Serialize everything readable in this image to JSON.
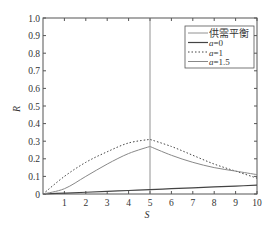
{
  "chart_data": {
    "type": "line",
    "title": "",
    "xlabel": "S",
    "ylabel": "R",
    "xlim": [
      0,
      10
    ],
    "ylim": [
      0,
      1.0
    ],
    "x_ticks": [
      "1",
      "2",
      "3",
      "4",
      "5",
      "6",
      "7",
      "8",
      "9",
      "10"
    ],
    "y_ticks": [
      "0",
      "0.1",
      "0.2",
      "0.3",
      "0.4",
      "0.5",
      "0.6",
      "0.7",
      "0.8",
      "0.9",
      "1.0"
    ],
    "grid": false,
    "legend_position": "upper right",
    "x": [
      0,
      1,
      2,
      3,
      4,
      5,
      6,
      7,
      8,
      9,
      10
    ],
    "series": [
      {
        "name": "供需平衡",
        "style": "vertical line",
        "x_value": 5
      },
      {
        "name": "a=0",
        "style": "solid",
        "values": [
          0,
          0.005,
          0.01,
          0.015,
          0.02,
          0.025,
          0.03,
          0.035,
          0.04,
          0.045,
          0.05
        ]
      },
      {
        "name": "a=1",
        "style": "dotted",
        "values": [
          0,
          0.1,
          0.18,
          0.24,
          0.29,
          0.31,
          0.27,
          0.22,
          0.17,
          0.13,
          0.09
        ]
      },
      {
        "name": "a=1.5",
        "style": "solid-gray",
        "values": [
          0,
          0.03,
          0.1,
          0.17,
          0.23,
          0.27,
          0.22,
          0.18,
          0.15,
          0.13,
          0.11
        ]
      }
    ]
  },
  "legend": {
    "items": [
      "供需平衡",
      "a=0",
      "a=1",
      "a=1.5"
    ]
  },
  "axes": {
    "xlabel": "S",
    "ylabel": "R"
  }
}
